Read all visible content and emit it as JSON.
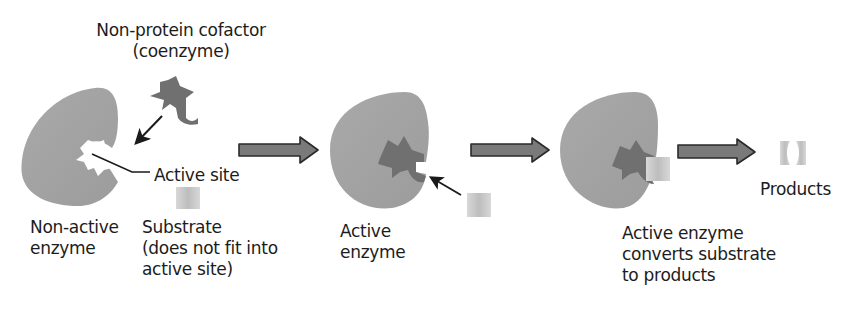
{
  "diagram": {
    "colors": {
      "enzyme": "#a4a4a4",
      "cofactor": "#6e6e6e",
      "substrate": "#c8c8c8",
      "arrow_fill": "#7a7a7a",
      "arrow_stroke": "#2a2a2a",
      "text": "#1c1c1c"
    },
    "labels": {
      "cofactor": "Non-protein cofactor\n(coenzyme)",
      "active_site": "Active site",
      "non_active_enzyme": "Non-active\nenzyme",
      "substrate": "Substrate\n(does not fit into\nactive site)",
      "active_enzyme": "Active\nenzyme",
      "converts": "Active enzyme\nconverts substrate\nto products",
      "products": "Products"
    },
    "stages": [
      {
        "id": "stage-1",
        "label": "Non-active enzyme",
        "has_cofactor": false
      },
      {
        "id": "stage-2",
        "label": "Active enzyme",
        "has_cofactor": true
      },
      {
        "id": "stage-3",
        "label": "Active enzyme converts substrate to products",
        "has_cofactor": true
      },
      {
        "id": "stage-4",
        "label": "Products"
      }
    ],
    "flow_arrows": 3
  }
}
